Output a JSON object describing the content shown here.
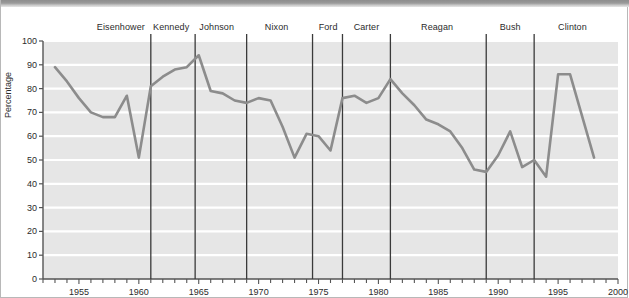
{
  "figure": {
    "title": "",
    "ylabel": "Percentage"
  },
  "chart_data": {
    "type": "line",
    "title": "",
    "xlabel": "",
    "ylabel": "Percentage",
    "xlim": [
      1952,
      2000
    ],
    "ylim": [
      0,
      100
    ],
    "grid": true,
    "legend_position": "none",
    "yticks": [
      0,
      10,
      20,
      30,
      40,
      50,
      60,
      70,
      80,
      90,
      100
    ],
    "ytick_labels": [
      "0",
      "10",
      "20",
      "30",
      "40",
      "50",
      "60",
      "70",
      "80",
      "90",
      "100"
    ],
    "xticks": [
      1955,
      1960,
      1965,
      1970,
      1975,
      1980,
      1985,
      1990,
      1995,
      2000
    ],
    "xtick_labels": [
      "1955",
      "1960",
      "1965",
      "1970",
      "1975",
      "1980",
      "1985",
      "1990",
      "1995",
      "2000"
    ],
    "x_minor_tick_interval": 1,
    "line_color": "#8c8c8c",
    "series": [
      {
        "name": "Percentage",
        "x": [
          1953,
          1954,
          1955,
          1956,
          1957,
          1958,
          1959,
          1960,
          1961,
          1962,
          1963,
          1964,
          1965,
          1966,
          1967,
          1968,
          1969,
          1970,
          1971,
          1972,
          1973,
          1974,
          1975,
          1976,
          1977,
          1978,
          1979,
          1980,
          1981,
          1982,
          1983,
          1984,
          1985,
          1986,
          1987,
          1988,
          1989,
          1990,
          1991,
          1992,
          1993,
          1994,
          1995,
          1996,
          1998
        ],
        "y": [
          89,
          83,
          76,
          70,
          68,
          68,
          77,
          51,
          81,
          85,
          88,
          89,
          94,
          79,
          78,
          75,
          74,
          76,
          75,
          64,
          51,
          61,
          60,
          54,
          76,
          77,
          74,
          76,
          84,
          78,
          73,
          67,
          65,
          62,
          55,
          46,
          45,
          52,
          62,
          47,
          50,
          43,
          86,
          86,
          51
        ]
      }
    ],
    "vertical_markers": [
      {
        "label": "Eisenhower",
        "year_start": 1952,
        "year_end": 1961,
        "label_year": 1958.5
      },
      {
        "label": "Kennedy",
        "year_start": 1961,
        "year_end": 1964.7,
        "label_year": 1962.7
      },
      {
        "label": "Johnson",
        "year_start": 1964.7,
        "year_end": 1969,
        "label_year": 1966.5
      },
      {
        "label": "Nixon",
        "year_start": 1969,
        "year_end": 1974.5,
        "label_year": 1971.5
      },
      {
        "label": "Ford",
        "year_start": 1974.5,
        "year_end": 1977,
        "label_year": 1975.8
      },
      {
        "label": "Carter",
        "year_start": 1977,
        "year_end": 1981,
        "label_year": 1979
      },
      {
        "label": "Reagan",
        "year_start": 1981,
        "year_end": 1989,
        "label_year": 1984.9
      },
      {
        "label": "Bush",
        "year_start": 1989,
        "year_end": 1993,
        "label_year": 1991
      },
      {
        "label": "Clinton",
        "year_start": 1993,
        "year_end": 2000,
        "label_year": 1996.2
      }
    ],
    "divider_years": [
      1961,
      1964.7,
      1969,
      1974.5,
      1977,
      1981,
      1989,
      1993
    ],
    "colors": {
      "plot_background": "#e6e6e6",
      "gridline": "#ffffff",
      "axis": "#555555",
      "divider": "#3a3a3a",
      "text": "#2b2b2b"
    }
  }
}
